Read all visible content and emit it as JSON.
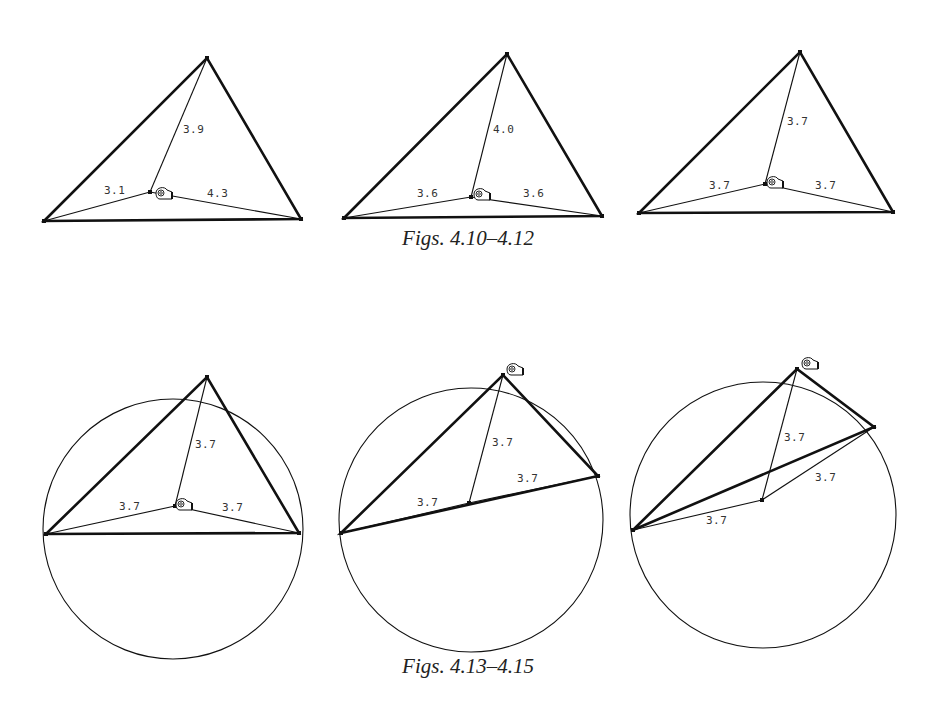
{
  "captions": {
    "top": "Figs. 4.10–4.12",
    "bottom": "Figs. 4.13–4.15"
  },
  "colors": {
    "ink": "#111111",
    "label": "#333333",
    "background": "#ffffff"
  },
  "figures": [
    {
      "id": "4.10",
      "vertices": [
        [
          44,
          221
        ],
        [
          207,
          58
        ],
        [
          301,
          219
        ]
      ],
      "point": [
        150,
        192
      ],
      "labels": [
        {
          "text": "3.9",
          "x": 183,
          "y": 133
        },
        {
          "text": "3.1",
          "x": 104,
          "y": 194
        },
        {
          "text": "4.3",
          "x": 207,
          "y": 197
        }
      ],
      "eye": [
        163,
        195
      ]
    },
    {
      "id": "4.11",
      "vertices": [
        [
          344,
          218
        ],
        [
          507,
          54
        ],
        [
          602,
          216
        ]
      ],
      "point": [
        471,
        197
      ],
      "labels": [
        {
          "text": "4.0",
          "x": 493,
          "y": 133
        },
        {
          "text": "3.6",
          "x": 417,
          "y": 197
        },
        {
          "text": "3.6",
          "x": 523,
          "y": 197
        }
      ],
      "eye": [
        481,
        196
      ]
    },
    {
      "id": "4.12",
      "vertices": [
        [
          639,
          213
        ],
        [
          800,
          52
        ],
        [
          893,
          212
        ]
      ],
      "point": [
        765,
        184
      ],
      "labels": [
        {
          "text": "3.7",
          "x": 787,
          "y": 125
        },
        {
          "text": "3.7",
          "x": 709,
          "y": 189
        },
        {
          "text": "3.7",
          "x": 815,
          "y": 189
        }
      ],
      "eye": [
        774,
        184
      ]
    },
    {
      "id": "4.13",
      "circle": {
        "cx": 173,
        "cy": 529,
        "r": 130
      },
      "vertices": [
        [
          46,
          534
        ],
        [
          207,
          377
        ],
        [
          299,
          533
        ]
      ],
      "point": [
        175,
        506
      ],
      "labels": [
        {
          "text": "3.7",
          "x": 195,
          "y": 448
        },
        {
          "text": "3.7",
          "x": 119,
          "y": 510
        },
        {
          "text": "3.7",
          "x": 222,
          "y": 511
        }
      ],
      "eye": [
        183,
        506
      ]
    },
    {
      "id": "4.14",
      "circle": {
        "cx": 471,
        "cy": 520,
        "r": 132
      },
      "vertices": [
        [
          341,
          533
        ],
        [
          503,
          375
        ],
        [
          598,
          476
        ]
      ],
      "point": [
        469,
        503
      ],
      "labels": [
        {
          "text": "3.7",
          "x": 492,
          "y": 446
        },
        {
          "text": "3.7",
          "x": 417,
          "y": 506
        },
        {
          "text": "3.7",
          "x": 517,
          "y": 482
        }
      ],
      "eye": [
        514,
        371
      ]
    },
    {
      "id": "4.15",
      "circle": {
        "cx": 763,
        "cy": 515,
        "r": 133
      },
      "vertices": [
        [
          633,
          530
        ],
        [
          797,
          369
        ],
        [
          874,
          427
        ]
      ],
      "point": [
        762,
        500
      ],
      "labels": [
        {
          "text": "3.7",
          "x": 784,
          "y": 441
        },
        {
          "text": "3.7",
          "x": 706,
          "y": 524
        },
        {
          "text": "3.7",
          "x": 815,
          "y": 481
        }
      ],
      "eye": [
        809,
        365
      ]
    }
  ]
}
